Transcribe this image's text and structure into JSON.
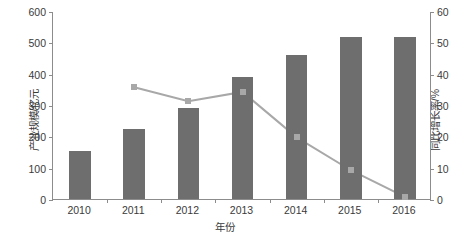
{
  "chart_data": {
    "type": "bar",
    "title": "",
    "subtitle": "",
    "xlabel": "年份",
    "ylabel": "产业规模/亿元",
    "y2label": "同比增长率/%",
    "categories": [
      "2010",
      "2011",
      "2012",
      "2013",
      "2014",
      "2015",
      "2016"
    ],
    "ylim": [
      0,
      600
    ],
    "y2lim": [
      0,
      60
    ],
    "yticks": [
      "0",
      "100",
      "200",
      "300",
      "400",
      "500",
      "600"
    ],
    "ytick_values": [
      0,
      100,
      200,
      300,
      400,
      500,
      600
    ],
    "y2ticks": [
      "0",
      "10",
      "20",
      "30",
      "40",
      "50",
      "60"
    ],
    "y2tick_values": [
      0,
      10,
      20,
      30,
      40,
      50,
      60
    ],
    "grid": false,
    "legend": "none",
    "series": [
      {
        "name": "产业规模/亿元",
        "type": "bar",
        "axis": "left",
        "color": "#6e6e6e",
        "values": [
          152,
          222,
          291,
          388,
          460,
          516,
          517
        ]
      },
      {
        "name": "同比增长率/%",
        "type": "line",
        "axis": "right",
        "color": "#a8a8a8",
        "marker": "square",
        "values": [
          null,
          36.0,
          31.5,
          34.5,
          20.0,
          9.5,
          1.0
        ]
      }
    ]
  },
  "axes": {
    "left_title": "产业规模/亿元",
    "right_title": "同比增长率/%",
    "bottom_title": "年份"
  },
  "colors": {
    "bar": "#6e6e6e",
    "line": "#a8a8a8",
    "axis": "#8c8c8c",
    "text": "#3a3a3a",
    "background": "#ffffff"
  }
}
